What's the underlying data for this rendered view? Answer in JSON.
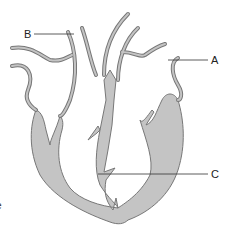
{
  "diagram": {
    "colors": {
      "fill": "#c4c4c4",
      "stroke": "#777777",
      "leader": "#333333",
      "background": "#ffffff"
    },
    "labels": [
      {
        "id": "A",
        "text": "A"
      },
      {
        "id": "B",
        "text": "B"
      },
      {
        "id": "C",
        "text": "C"
      }
    ],
    "cropped_text": "e"
  }
}
